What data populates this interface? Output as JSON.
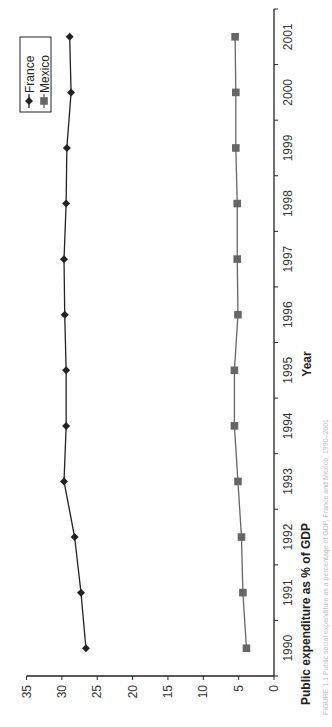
{
  "chart_data": {
    "type": "line",
    "orientation": "rotated-90-clockwise",
    "title": "",
    "caption": "FIGURE 1.1 Public social expenditure as a percentage of GDP, France and Mexico, 1990–2001",
    "xlabel": "Year",
    "ylabel": "Public expenditure as % of GDP",
    "categories": [
      "1990",
      "1991",
      "1992",
      "1993",
      "1994",
      "1995",
      "1996",
      "1997",
      "1998",
      "1999",
      "2000",
      "2001"
    ],
    "series": [
      {
        "name": "France",
        "marker": "diamond",
        "color": "#222222",
        "values": [
          26.6,
          27.3,
          28.2,
          29.7,
          29.4,
          29.4,
          29.6,
          29.7,
          29.4,
          29.3,
          28.7,
          28.9
        ]
      },
      {
        "name": "Mexico",
        "marker": "square",
        "color": "#666666",
        "values": [
          3.9,
          4.4,
          4.6,
          5.1,
          5.6,
          5.6,
          5.1,
          5.2,
          5.2,
          5.4,
          5.4,
          5.5
        ]
      }
    ],
    "ylim": [
      0,
      35
    ],
    "yticks": [
      "0",
      "5",
      "10",
      "15",
      "20",
      "25",
      "30",
      "35"
    ],
    "grid": false,
    "legend_position": "top-left (rotated view), boxed"
  }
}
